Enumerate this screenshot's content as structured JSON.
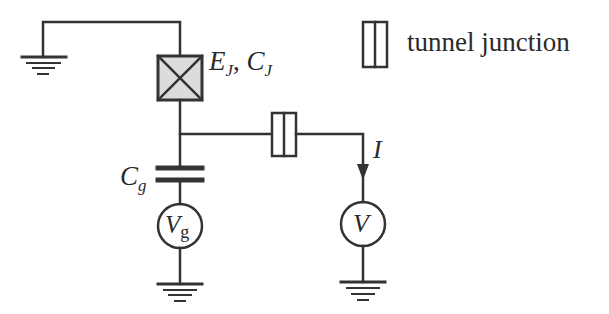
{
  "diagram": {
    "type": "circuit-schematic",
    "colors": {
      "line": "#333333",
      "junction_fill": "#dcdcdc",
      "text": "#2a2a2a",
      "background": "#ffffff"
    },
    "labels": {
      "josephson_main": "E",
      "josephson_main_sub": "J",
      "josephson_sep": ", ",
      "josephson_cap": "C",
      "josephson_cap_sub": "J",
      "gate_cap": "C",
      "gate_cap_sub": "g",
      "gate_source": "V",
      "gate_source_sub": "g",
      "voltmeter": "V",
      "current": "I",
      "legend_tunnel_junction": "tunnel junction"
    },
    "components": [
      {
        "id": "ground-left",
        "kind": "ground"
      },
      {
        "id": "josephson-junction",
        "kind": "josephson-junction",
        "label": "E_J, C_J"
      },
      {
        "id": "tunnel-junction",
        "kind": "tunnel-junction"
      },
      {
        "id": "gate-capacitor",
        "kind": "capacitor",
        "label": "C_g"
      },
      {
        "id": "gate-voltage-source",
        "kind": "voltage-source",
        "label": "V_g"
      },
      {
        "id": "ground-gate",
        "kind": "ground"
      },
      {
        "id": "current-arrow",
        "kind": "current-direction",
        "label": "I"
      },
      {
        "id": "voltmeter",
        "kind": "voltage-source",
        "label": "V"
      },
      {
        "id": "ground-right",
        "kind": "ground"
      }
    ],
    "legend": [
      {
        "symbol": "tunnel-junction",
        "text": "tunnel junction"
      }
    ]
  }
}
